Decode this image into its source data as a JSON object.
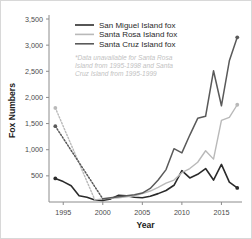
{
  "chart_data": {
    "type": "line",
    "title": "",
    "xlabel": "Year",
    "ylabel": "Fox Numbers",
    "xlim": [
      1993.2,
      2017.6
    ],
    "ylim": [
      0,
      3500
    ],
    "xticks": [
      1995,
      2000,
      2005,
      2010,
      2015
    ],
    "xtick_labels": [
      "1995",
      "2000",
      "2005",
      "2010",
      "2015"
    ],
    "yticks": [
      500,
      1000,
      1500,
      2000,
      2500,
      3000,
      3500
    ],
    "ytick_labels": [
      "500",
      "1,000",
      "1,500",
      "2,000",
      "2,500",
      "3,000",
      "3,500"
    ],
    "grid": false,
    "legend_position": "top-center",
    "annotation": "*Data unavailable for Santa Rosa Island from 1995-1998 and Santa Cruz Island from 1995-1999",
    "annotation_lines": [
      "*Data unavailable for Santa Rosa",
      "Island from 1995-1998 and Santa",
      "Cruz Island from 1995-1999"
    ],
    "series": [
      {
        "name": "San Miguel Island fox",
        "color": "#2b2b2b",
        "width": 1.6,
        "start_marker": {
          "x": 1994,
          "y": 450
        },
        "end_marker": {
          "x": 2017,
          "y": 270
        },
        "x": [
          1994,
          1995,
          1996,
          1997,
          1998,
          1999,
          2000,
          2001,
          2002,
          2003,
          2004,
          2005,
          2006,
          2007,
          2008,
          2009,
          2010,
          2011,
          2012,
          2013,
          2014,
          2015,
          2016,
          2017
        ],
        "values": [
          450,
          390,
          310,
          120,
          90,
          40,
          30,
          60,
          130,
          120,
          90,
          80,
          110,
          160,
          220,
          320,
          600,
          460,
          530,
          640,
          420,
          720,
          380,
          270
        ]
      },
      {
        "name": "Santa Rosa Island fox",
        "color": "#b9b9b9",
        "width": 1.4,
        "start_marker": {
          "x": 1994,
          "y": 1800
        },
        "end_marker": {
          "x": 2017,
          "y": 1860
        },
        "gap_dotted": {
          "from_year": 1994,
          "to_year": 1999
        },
        "x": [
          1994,
          1999,
          2000,
          2001,
          2002,
          2003,
          2004,
          2005,
          2006,
          2007,
          2008,
          2009,
          2010,
          2011,
          2012,
          2013,
          2014,
          2015,
          2016,
          2017
        ],
        "values": [
          1800,
          40,
          60,
          70,
          80,
          100,
          120,
          160,
          210,
          280,
          360,
          420,
          560,
          640,
          760,
          980,
          820,
          1560,
          1620,
          1860
        ]
      },
      {
        "name": "Santa Cruz Island fox",
        "color": "#5a5a5a",
        "width": 1.5,
        "start_marker": {
          "x": 1994,
          "y": 1450
        },
        "end_marker": {
          "x": 2017,
          "y": 3150
        },
        "gap_dotted": {
          "from_year": 1994,
          "to_year": 2000
        },
        "x": [
          1994,
          2000,
          2001,
          2002,
          2003,
          2004,
          2005,
          2006,
          2007,
          2008,
          2009,
          2010,
          2011,
          2012,
          2013,
          2014,
          2015,
          2016,
          2017
        ],
        "values": [
          1450,
          60,
          80,
          100,
          120,
          140,
          170,
          260,
          420,
          620,
          1020,
          940,
          1280,
          1600,
          1640,
          2510,
          1840,
          2700,
          3150
        ]
      }
    ],
    "legend": [
      {
        "label": "San Miguel Island fox",
        "color": "#2b2b2b"
      },
      {
        "label": "Santa Rosa Island fox",
        "color": "#b9b9b9"
      },
      {
        "label": "Santa Cruz Island fox",
        "color": "#5a5a5a"
      }
    ]
  }
}
